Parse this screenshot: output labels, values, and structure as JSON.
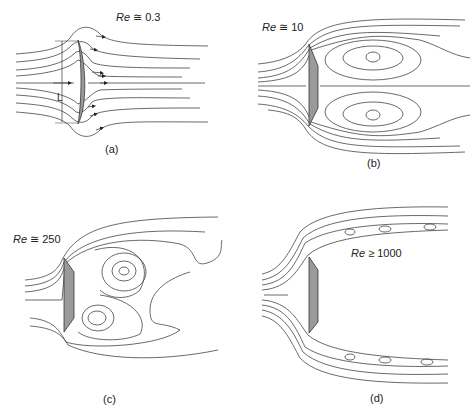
{
  "figure": {
    "panels": [
      {
        "id": "a",
        "caption": "(a)",
        "re_symbol": "Re",
        "re_relation": "≅",
        "re_value": "0.3",
        "dimension_label": "L"
      },
      {
        "id": "b",
        "caption": "(b)",
        "re_symbol": "Re",
        "re_relation": "≅",
        "re_value": "10"
      },
      {
        "id": "c",
        "caption": "(c)",
        "re_symbol": "Re",
        "re_relation": "≅",
        "re_value": "250"
      },
      {
        "id": "d",
        "caption": "(d)",
        "re_symbol": "Re",
        "re_relation": "≥",
        "re_value": "1000"
      }
    ],
    "colors": {
      "line": "#333333",
      "plate_fill": "#9a9a9a",
      "background": "#ffffff"
    }
  }
}
